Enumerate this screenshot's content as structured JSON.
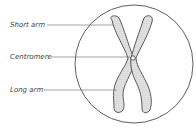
{
  "diagram": {
    "labels": [
      {
        "id": "short-arm",
        "text": "Short arm"
      },
      {
        "id": "centromere",
        "text": "Centromere"
      },
      {
        "id": "long-arm",
        "text": "Long arm"
      }
    ],
    "colors": {
      "stroke": "#333333",
      "line": "#666666",
      "text": "#444444",
      "fill": "#d8d8d8"
    }
  }
}
